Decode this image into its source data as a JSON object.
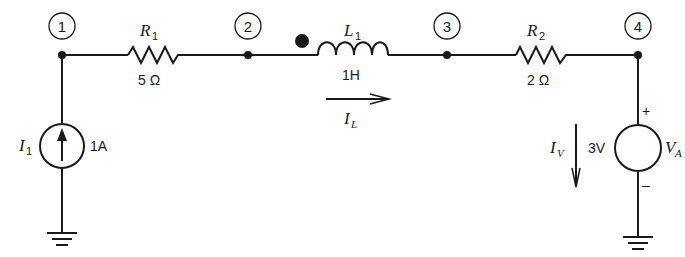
{
  "diagram": {
    "type": "circuit-schematic",
    "nodes": [
      {
        "id": "1",
        "label": "1"
      },
      {
        "id": "2",
        "label": "2"
      },
      {
        "id": "3",
        "label": "3"
      },
      {
        "id": "4",
        "label": "4"
      }
    ],
    "components": {
      "R1": {
        "symbol": "R",
        "subscript": "1",
        "value": "5 Ω",
        "between": [
          "1",
          "2"
        ]
      },
      "L1": {
        "symbol": "L",
        "subscript": "1",
        "value": "1H",
        "between": [
          "2",
          "3"
        ],
        "polarity_dot": true
      },
      "R2": {
        "symbol": "R",
        "subscript": "2",
        "value": "2 Ω",
        "between": [
          "3",
          "4"
        ]
      },
      "I1": {
        "symbol": "I",
        "subscript": "1",
        "value": "1A",
        "type": "current-source",
        "node": "1",
        "direction": "up"
      },
      "VA": {
        "symbol": "V",
        "subscript": "A",
        "value": "3V",
        "type": "voltage-source",
        "node": "4",
        "plus": "+",
        "minus": "–"
      }
    },
    "currents": {
      "IL": {
        "symbol": "I",
        "subscript": "L",
        "direction": "right"
      },
      "IV": {
        "symbol": "I",
        "subscript": "V",
        "direction": "down"
      }
    }
  }
}
